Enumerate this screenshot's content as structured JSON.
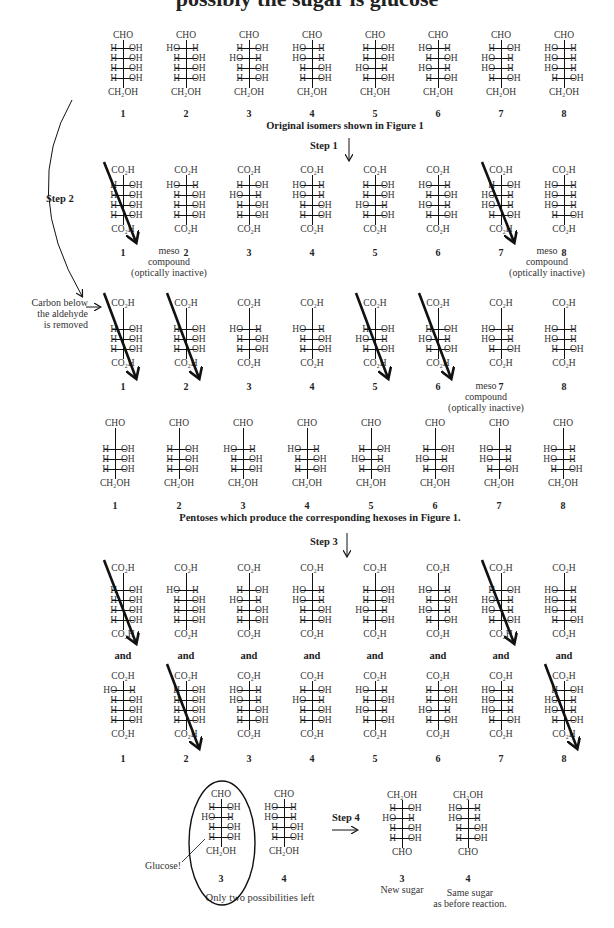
{
  "title_fragment": "possibly the sugar is glucose",
  "columns_x": [
    123,
    186,
    249,
    312,
    375,
    438,
    501,
    564
  ],
  "rows": {
    "original": {
      "caption": "Original isomers shown in Figure 1",
      "top": "CHO",
      "bottom": "CH₂OH",
      "structures": [
        [
          [
            "H",
            "OH"
          ],
          [
            "H",
            "OH"
          ],
          [
            "H",
            "OH"
          ],
          [
            "H",
            "OH"
          ]
        ],
        [
          [
            "HO",
            "H"
          ],
          [
            "H",
            "OH"
          ],
          [
            "H",
            "OH"
          ],
          [
            "H",
            "OH"
          ]
        ],
        [
          [
            "H",
            "OH"
          ],
          [
            "HO",
            "H"
          ],
          [
            "H",
            "OH"
          ],
          [
            "H",
            "OH"
          ]
        ],
        [
          [
            "HO",
            "H"
          ],
          [
            "HO",
            "H"
          ],
          [
            "H",
            "OH"
          ],
          [
            "H",
            "OH"
          ]
        ],
        [
          [
            "H",
            "OH"
          ],
          [
            "H",
            "OH"
          ],
          [
            "HO",
            "H"
          ],
          [
            "H",
            "OH"
          ]
        ],
        [
          [
            "HO",
            "H"
          ],
          [
            "H",
            "OH"
          ],
          [
            "HO",
            "H"
          ],
          [
            "H",
            "OH"
          ]
        ],
        [
          [
            "H",
            "OH"
          ],
          [
            "HO",
            "H"
          ],
          [
            "HO",
            "H"
          ],
          [
            "H",
            "OH"
          ]
        ],
        [
          [
            "HO",
            "H"
          ],
          [
            "HO",
            "H"
          ],
          [
            "HO",
            "H"
          ],
          [
            "H",
            "OH"
          ]
        ]
      ]
    },
    "step1": {
      "top": "CO₂H",
      "bottom": "CO₂H",
      "crossed": [
        1,
        7
      ],
      "meso_notes": [
        {
          "after": 1,
          "text": [
            "meso",
            "compound",
            "(optically inactive)"
          ]
        },
        {
          "after": 7,
          "text": [
            "meso",
            "compound",
            "(optically inactive)"
          ]
        }
      ]
    },
    "step2": {
      "top": "CO₂H",
      "bottom": "CO₂H",
      "crossed": [
        1,
        2,
        5,
        6
      ],
      "structures": [
        [
          [
            "H",
            "OH"
          ],
          [
            "H",
            "OH"
          ],
          [
            "H",
            "OH"
          ]
        ],
        [
          [
            "H",
            "OH"
          ],
          [
            "H",
            "OH"
          ],
          [
            "H",
            "OH"
          ]
        ],
        [
          [
            "HO",
            "H"
          ],
          [
            "H",
            "OH"
          ],
          [
            "H",
            "OH"
          ]
        ],
        [
          [
            "HO",
            "H"
          ],
          [
            "H",
            "OH"
          ],
          [
            "H",
            "OH"
          ]
        ],
        [
          [
            "H",
            "OH"
          ],
          [
            "HO",
            "H"
          ],
          [
            "H",
            "OH"
          ]
        ],
        [
          [
            "H",
            "OH"
          ],
          [
            "HO",
            "H"
          ],
          [
            "H",
            "OH"
          ]
        ],
        [
          [
            "HO",
            "H"
          ],
          [
            "HO",
            "H"
          ],
          [
            "H",
            "OH"
          ]
        ],
        [
          [
            "HO",
            "H"
          ],
          [
            "HO",
            "H"
          ],
          [
            "H",
            "OH"
          ]
        ]
      ],
      "meso_note": {
        "after": 6,
        "text": [
          "meso",
          "compound",
          "(optically inactive)"
        ]
      }
    },
    "pentoses": {
      "caption": "Pentoses which produce the corresponding hexoses in Figure 1.",
      "top": "CHO",
      "bottom": "CH₂OH",
      "structures": [
        [
          [
            "H",
            "OH"
          ],
          [
            "H",
            "OH"
          ],
          [
            "H",
            "OH"
          ]
        ],
        [
          [
            "H",
            "OH"
          ],
          [
            "H",
            "OH"
          ],
          [
            "H",
            "OH"
          ]
        ],
        [
          [
            "HO",
            "H"
          ],
          [
            "H",
            "OH"
          ],
          [
            "H",
            "OH"
          ]
        ],
        [
          [
            "HO",
            "H"
          ],
          [
            "H",
            "OH"
          ],
          [
            "H",
            "OH"
          ]
        ],
        [
          [
            "H",
            "OH"
          ],
          [
            "HO",
            "H"
          ],
          [
            "H",
            "OH"
          ]
        ],
        [
          [
            "H",
            "OH"
          ],
          [
            "HO",
            "H"
          ],
          [
            "H",
            "OH"
          ]
        ],
        [
          [
            "HO",
            "H"
          ],
          [
            "HO",
            "H"
          ],
          [
            "H",
            "OH"
          ]
        ],
        [
          [
            "HO",
            "H"
          ],
          [
            "HO",
            "H"
          ],
          [
            "H",
            "OH"
          ]
        ]
      ]
    },
    "step3a": {
      "top": "CO₂H",
      "bottom": "CO₂H",
      "crossed": [
        1,
        7
      ]
    },
    "step3b": {
      "top": "CO₂H",
      "bottom": "CO₂H",
      "crossed": [
        2,
        8
      ],
      "structures": [
        [
          [
            "HO",
            "H"
          ],
          [
            "H",
            "OH"
          ],
          [
            "H",
            "OH"
          ],
          [
            "H",
            "OH"
          ]
        ],
        [
          [
            "H",
            "OH"
          ],
          [
            "H",
            "OH"
          ],
          [
            "H",
            "OH"
          ],
          [
            "H",
            "OH"
          ]
        ],
        [
          [
            "HO",
            "H"
          ],
          [
            "HO",
            "H"
          ],
          [
            "H",
            "OH"
          ],
          [
            "H",
            "OH"
          ]
        ],
        [
          [
            "H",
            "OH"
          ],
          [
            "HO",
            "H"
          ],
          [
            "H",
            "OH"
          ],
          [
            "H",
            "OH"
          ]
        ],
        [
          [
            "HO",
            "H"
          ],
          [
            "H",
            "OH"
          ],
          [
            "HO",
            "H"
          ],
          [
            "H",
            "OH"
          ]
        ],
        [
          [
            "H",
            "OH"
          ],
          [
            "H",
            "OH"
          ],
          [
            "HO",
            "H"
          ],
          [
            "H",
            "OH"
          ]
        ],
        [
          [
            "HO",
            "H"
          ],
          [
            "HO",
            "H"
          ],
          [
            "HO",
            "H"
          ],
          [
            "H",
            "OH"
          ]
        ],
        [
          [
            "H",
            "OH"
          ],
          [
            "HO",
            "H"
          ],
          [
            "HO",
            "H"
          ],
          [
            "H",
            "OH"
          ]
        ]
      ]
    },
    "final": {
      "caption": "Only two possibilities left",
      "glucose_label": "Glucose!",
      "left": [
        {
          "num": "3",
          "top": "CHO",
          "bottom": "CH₂OH",
          "subs": [
            [
              "H",
              "OH"
            ],
            [
              "HO",
              "H"
            ],
            [
              "H",
              "OH"
            ],
            [
              "H",
              "OH"
            ]
          ]
        },
        {
          "num": "4",
          "top": "CHO",
          "bottom": "CH₂OH",
          "subs": [
            [
              "HO",
              "H"
            ],
            [
              "HO",
              "H"
            ],
            [
              "H",
              "OH"
            ],
            [
              "H",
              "OH"
            ]
          ]
        }
      ],
      "right": [
        {
          "num": "3",
          "top": "CH₂OH",
          "bottom": "CHO",
          "subs": [
            [
              "H",
              "OH"
            ],
            [
              "HO",
              "H"
            ],
            [
              "H",
              "OH"
            ],
            [
              "H",
              "OH"
            ]
          ],
          "note": [
            "New sugar"
          ]
        },
        {
          "num": "4",
          "top": "CH₂OH",
          "bottom": "CHO",
          "subs": [
            [
              "HO",
              "H"
            ],
            [
              "HO",
              "H"
            ],
            [
              "H",
              "OH"
            ],
            [
              "H",
              "OH"
            ]
          ],
          "note": [
            "Same sugar",
            "as before reaction."
          ]
        }
      ]
    }
  },
  "labels": {
    "step1": "Step 1",
    "step2": "Step 2",
    "step3": "Step 3",
    "step4": "Step 4",
    "and": "and",
    "carbon_removed": [
      "Carbon below",
      "the aldehyde",
      "is removed"
    ]
  },
  "numbers": [
    "1",
    "2",
    "3",
    "4",
    "5",
    "6",
    "7",
    "8"
  ]
}
